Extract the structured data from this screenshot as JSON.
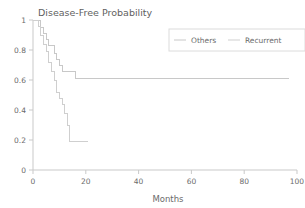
{
  "chart_data": {
    "type": "line",
    "title": "Disease-Free Probability",
    "xlabel": "Months",
    "ylabel": "",
    "xlim": [
      0,
      100
    ],
    "ylim": [
      0,
      1
    ],
    "grid": false,
    "legend_position": "upper-right",
    "xticks": [
      "0",
      "20",
      "40",
      "60",
      "80",
      "100"
    ],
    "xtick_values": [
      0,
      20,
      40,
      60,
      80,
      100
    ],
    "yticks": [
      "0",
      "0.2",
      "0.4",
      "0.6",
      "0.8",
      "1"
    ],
    "ytick_values": [
      0,
      0.2,
      0.4,
      0.6,
      0.8,
      1
    ],
    "series": [
      {
        "name": "Others",
        "color": "#c8c8c8",
        "step": "post",
        "x": [
          0,
          2,
          3,
          4,
          5,
          6,
          7,
          8,
          9,
          10,
          11,
          13,
          16,
          97
        ],
        "y": [
          1.0,
          1.0,
          0.95,
          0.91,
          0.87,
          0.83,
          0.83,
          0.78,
          0.74,
          0.7,
          0.66,
          0.66,
          0.61,
          0.61
        ]
      },
      {
        "name": "Recurrent",
        "color": "#cfcfcf",
        "step": "post",
        "x": [
          0,
          2,
          3,
          4,
          5,
          6,
          7,
          8,
          9,
          10,
          11,
          12,
          13,
          14,
          21
        ],
        "y": [
          1.0,
          0.96,
          0.9,
          0.84,
          0.79,
          0.72,
          0.66,
          0.6,
          0.52,
          0.48,
          0.44,
          0.38,
          0.3,
          0.19,
          0.19
        ]
      }
    ]
  },
  "legend": {
    "entries": [
      {
        "label": "Others"
      },
      {
        "label": "Recurrent"
      }
    ]
  }
}
